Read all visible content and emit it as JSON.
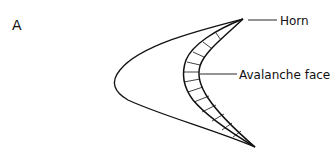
{
  "figure": {
    "panel_label": "A",
    "labels": {
      "horn": "Horn",
      "avalanche_face": "Avalanche face"
    },
    "colors": {
      "stroke": "#111111",
      "background": "#ffffff"
    }
  }
}
